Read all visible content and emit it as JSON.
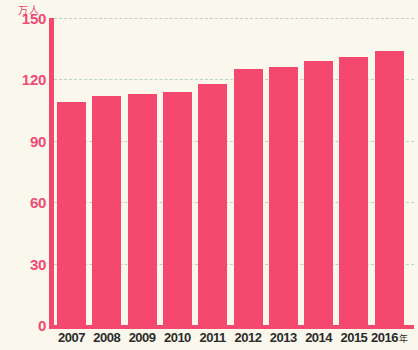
{
  "chart_data": {
    "type": "bar",
    "title": "",
    "xlabel": "年",
    "ylabel": "万人",
    "unit_label": "万人",
    "year_suffix": "年",
    "categories": [
      "2007",
      "2008",
      "2009",
      "2010",
      "2011",
      "2012",
      "2013",
      "2014",
      "2015",
      "2016"
    ],
    "values": [
      109,
      112,
      113,
      114,
      118,
      125,
      126,
      129,
      131,
      134
    ],
    "ylim": [
      0,
      150
    ],
    "yticks": [
      0,
      30,
      60,
      90,
      120,
      150
    ],
    "ytick_labels": [
      "0",
      "30",
      "60",
      "90",
      "120",
      "150"
    ],
    "grid": true,
    "legend": "none",
    "series": [
      {
        "name": "人数",
        "values": [
          109,
          112,
          113,
          114,
          118,
          125,
          126,
          129,
          131,
          134
        ]
      }
    ]
  },
  "style": {
    "bar_color": "#f4486e",
    "axis_color": "#f4486e",
    "background": "#faf8ec",
    "gridline_color": "#b9d4c0",
    "ytick_text_color": "#ee4a73",
    "xtick_text_color": "#2b2b2b"
  }
}
